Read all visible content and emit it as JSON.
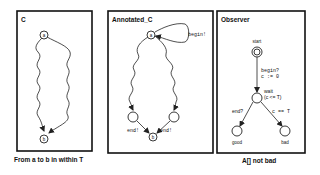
{
  "panels": [
    {
      "title": "C",
      "caption": "From a to b in within T",
      "nodes": [
        {
          "id": "a",
          "label": "a"
        },
        {
          "id": "b",
          "label": "b"
        }
      ],
      "edges": [
        {
          "from": "a",
          "to": "b",
          "style": "wavy"
        },
        {
          "from": "a",
          "to": "b",
          "style": "wavy"
        }
      ]
    },
    {
      "title": "Annotated_C",
      "caption": "",
      "nodes": [
        {
          "id": "a",
          "label": "a"
        },
        {
          "id": "l",
          "label": ""
        },
        {
          "id": "r",
          "label": ""
        },
        {
          "id": "b",
          "label": "b"
        }
      ],
      "edges": [
        {
          "from": "a",
          "to": "a",
          "label": "begin!",
          "style": "self-loop"
        },
        {
          "from": "a",
          "to": "l",
          "style": "wavy"
        },
        {
          "from": "a",
          "to": "r",
          "style": "wavy"
        },
        {
          "from": "l",
          "to": "b",
          "label": "end!"
        },
        {
          "from": "r",
          "to": "b",
          "label": "end!"
        }
      ]
    },
    {
      "title": "Observer",
      "caption": "A[] not bad",
      "nodes": [
        {
          "id": "start",
          "label": "start",
          "initial": true
        },
        {
          "id": "wait",
          "label": "wait",
          "invariant": "(c <= T)"
        },
        {
          "id": "good",
          "label": "good"
        },
        {
          "id": "bad",
          "label": "bad"
        }
      ],
      "edges": [
        {
          "from": "start",
          "to": "wait",
          "sync": "begin?",
          "update": "c := 0"
        },
        {
          "from": "wait",
          "to": "good",
          "sync": "end?"
        },
        {
          "from": "wait",
          "to": "bad",
          "guard": "c == T"
        }
      ]
    }
  ]
}
